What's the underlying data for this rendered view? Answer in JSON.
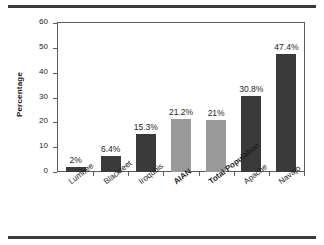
{
  "chart_data": {
    "type": "bar",
    "title": "",
    "subtitle": "",
    "xlabel": "",
    "ylabel": "Percentage",
    "ylim": [
      0,
      60
    ],
    "ytick_labels": [
      "60",
      "50",
      "40",
      "30",
      "20",
      "10",
      "0"
    ],
    "ytick_values": [
      60,
      50,
      40,
      30,
      20,
      10,
      0
    ],
    "grid": false,
    "legend": false,
    "legend_position": "none",
    "categories": [
      "Lumbee",
      "Blackfeet",
      "Iroquois",
      "AIAN",
      "Total Population",
      "Apache",
      "Navajo"
    ],
    "values": [
      2,
      6.4,
      15.3,
      21.2,
      21,
      30.8,
      47.4
    ],
    "data_labels": [
      "2%",
      "6.4%",
      "15.3%",
      "21.2%",
      "21%",
      "30.8%",
      "47.4%"
    ],
    "bar_styles": [
      "dark",
      "dark",
      "dark",
      "light",
      "light",
      "dark",
      "dark"
    ],
    "label_emphasis": [
      "normal",
      "normal",
      "normal",
      "bold",
      "bold",
      "normal",
      "normal"
    ],
    "colors": {
      "dark_bar": "#3a3a3a",
      "light_bar": "#9a9a9a",
      "axis": "#5c5c5c",
      "text": "#1d1d1d",
      "rule": "#3b3b3b",
      "background": "#ffffff"
    }
  }
}
